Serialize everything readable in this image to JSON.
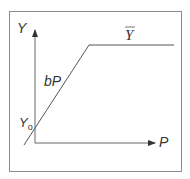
{
  "diagram": {
    "type": "piecewise-linear function",
    "axes": {
      "y_label": "Y",
      "x_label": "P"
    },
    "labels": {
      "intercept": "Y",
      "intercept_sub": "o",
      "slope": "bP",
      "cap": "Y"
    },
    "colors": {
      "line": "#555555",
      "frame": "#8a8a8a",
      "text": "#333333"
    }
  }
}
